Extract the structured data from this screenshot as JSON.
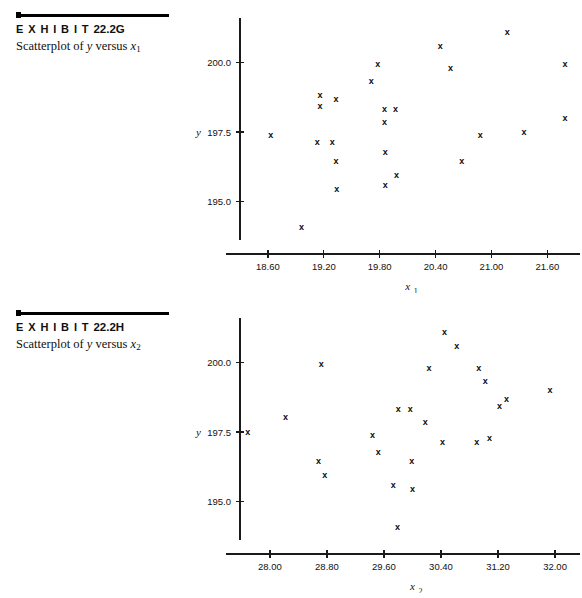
{
  "page": {
    "background_color": "#ffffff",
    "ink_color": "#101010"
  },
  "exhibits": [
    {
      "id": "22.2G",
      "label_prefix": "E X H I B I T",
      "label_number": "22.2G",
      "caption_prefix": "Scatterplot of ",
      "caption_var_y": "y",
      "caption_mid": " versus ",
      "caption_var_x": "x",
      "caption_var_x_sub": "1"
    },
    {
      "id": "22.2H",
      "label_prefix": "E X H I B I T",
      "label_number": "22.2H",
      "caption_prefix": "Scatterplot of ",
      "caption_var_y": "y",
      "caption_mid": " versus ",
      "caption_var_x": "x",
      "caption_var_x_sub": "2"
    }
  ],
  "chart_data": [
    {
      "type": "scatter",
      "id": "exhibit-22-2g",
      "title": "Scatterplot of y versus x1",
      "xlabel": "x",
      "xlabel_sub": "1",
      "ylabel": "y",
      "marker": "x",
      "grid": false,
      "legend": "none",
      "xlim": [
        18.3,
        21.95
      ],
      "ylim": [
        193.4,
        201.6
      ],
      "xticks": [
        "18.60",
        "19.20",
        "19.80",
        "20.40",
        "21.00",
        "21.60"
      ],
      "xtick_values": [
        18.6,
        19.2,
        19.8,
        20.4,
        21.0,
        21.6
      ],
      "yticks": [
        "195.0",
        "197.5",
        "200.0"
      ],
      "ytick_values": [
        195.0,
        197.5,
        200.0
      ],
      "points": [
        {
          "x": 18.63,
          "y": 197.4
        },
        {
          "x": 18.96,
          "y": 194.1
        },
        {
          "x": 19.13,
          "y": 197.15
        },
        {
          "x": 19.16,
          "y": 198.85
        },
        {
          "x": 19.16,
          "y": 198.45
        },
        {
          "x": 19.29,
          "y": 197.15
        },
        {
          "x": 19.33,
          "y": 198.7
        },
        {
          "x": 19.33,
          "y": 196.45
        },
        {
          "x": 19.34,
          "y": 195.45
        },
        {
          "x": 19.71,
          "y": 199.35
        },
        {
          "x": 19.78,
          "y": 199.95
        },
        {
          "x": 19.85,
          "y": 198.35
        },
        {
          "x": 19.85,
          "y": 197.85
        },
        {
          "x": 19.86,
          "y": 196.8
        },
        {
          "x": 19.86,
          "y": 195.6
        },
        {
          "x": 19.97,
          "y": 198.35
        },
        {
          "x": 19.98,
          "y": 195.95
        },
        {
          "x": 20.45,
          "y": 200.6
        },
        {
          "x": 20.56,
          "y": 199.8
        },
        {
          "x": 20.68,
          "y": 196.45
        },
        {
          "x": 20.88,
          "y": 197.4
        },
        {
          "x": 21.17,
          "y": 201.1
        },
        {
          "x": 21.35,
          "y": 197.5
        },
        {
          "x": 21.79,
          "y": 199.95
        },
        {
          "x": 21.79,
          "y": 198.0
        }
      ]
    },
    {
      "type": "scatter",
      "id": "exhibit-22-2h",
      "title": "Scatterplot of y versus x2",
      "xlabel": "x",
      "xlabel_sub": "2",
      "ylabel": "y",
      "marker": "x",
      "grid": false,
      "legend": "none",
      "xlim": [
        27.58,
        32.35
      ],
      "ylim": [
        193.4,
        201.6
      ],
      "xticks": [
        "28.00",
        "28.80",
        "29.60",
        "30.40",
        "31.20",
        "32.00"
      ],
      "xtick_values": [
        28.0,
        28.8,
        29.6,
        30.4,
        31.2,
        32.0
      ],
      "yticks": [
        "195.0",
        "197.5",
        "200.0"
      ],
      "ytick_values": [
        195.0,
        197.5,
        200.0
      ],
      "points": [
        {
          "x": 27.69,
          "y": 197.5
        },
        {
          "x": 28.22,
          "y": 198.05
        },
        {
          "x": 28.72,
          "y": 199.95
        },
        {
          "x": 28.68,
          "y": 196.45
        },
        {
          "x": 28.77,
          "y": 195.95
        },
        {
          "x": 29.44,
          "y": 197.4
        },
        {
          "x": 29.52,
          "y": 196.8
        },
        {
          "x": 29.8,
          "y": 198.35
        },
        {
          "x": 29.73,
          "y": 195.6
        },
        {
          "x": 29.79,
          "y": 194.1
        },
        {
          "x": 29.97,
          "y": 198.35
        },
        {
          "x": 29.99,
          "y": 196.45
        },
        {
          "x": 30.0,
          "y": 195.45
        },
        {
          "x": 30.18,
          "y": 197.85
        },
        {
          "x": 30.23,
          "y": 199.8
        },
        {
          "x": 30.45,
          "y": 201.1
        },
        {
          "x": 30.42,
          "y": 197.15
        },
        {
          "x": 30.62,
          "y": 200.6
        },
        {
          "x": 30.93,
          "y": 199.8
        },
        {
          "x": 30.9,
          "y": 197.15
        },
        {
          "x": 31.02,
          "y": 199.35
        },
        {
          "x": 31.08,
          "y": 197.3
        },
        {
          "x": 31.22,
          "y": 198.45
        },
        {
          "x": 31.32,
          "y": 198.7
        },
        {
          "x": 31.93,
          "y": 199.0
        }
      ]
    }
  ]
}
